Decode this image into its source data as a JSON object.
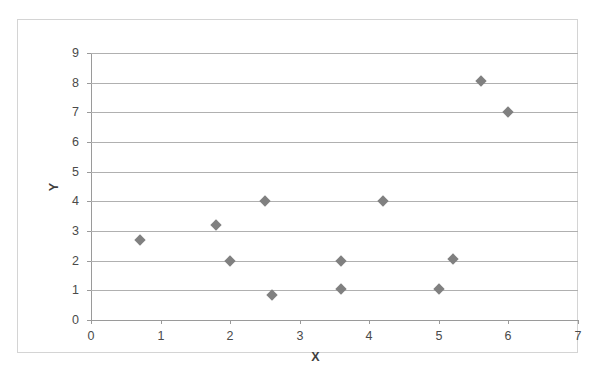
{
  "chart_data": {
    "type": "scatter",
    "title": "",
    "xlabel": "X",
    "ylabel": "Y",
    "xlim": [
      0,
      7
    ],
    "ylim": [
      0,
      9
    ],
    "x_ticks": [
      "0",
      "1",
      "2",
      "3",
      "4",
      "5",
      "6",
      "7"
    ],
    "y_ticks": [
      "0",
      "1",
      "2",
      "3",
      "4",
      "5",
      "6",
      "7",
      "8",
      "9"
    ],
    "grid": "horizontal",
    "legend": "none",
    "marker": {
      "shape": "diamond",
      "color": "#808080",
      "size": 8
    },
    "series": [
      {
        "name": "Series 1",
        "points": [
          {
            "x": 0.7,
            "y": 2.7
          },
          {
            "x": 1.8,
            "y": 3.2
          },
          {
            "x": 2.0,
            "y": 2.0
          },
          {
            "x": 2.5,
            "y": 4.0
          },
          {
            "x": 2.6,
            "y": 0.85
          },
          {
            "x": 3.6,
            "y": 2.0
          },
          {
            "x": 3.6,
            "y": 1.05
          },
          {
            "x": 4.2,
            "y": 4.0
          },
          {
            "x": 5.0,
            "y": 1.05
          },
          {
            "x": 5.2,
            "y": 2.05
          },
          {
            "x": 5.6,
            "y": 8.05
          },
          {
            "x": 6.0,
            "y": 7.0
          }
        ]
      }
    ]
  },
  "colors": {
    "marker": "#808080",
    "gridline": "#b0b0b0",
    "axis": "#9a9a9a",
    "frame": "#d4d4d4",
    "tick_text": "#4a4a4a",
    "title_text": "#3f3f3f"
  }
}
